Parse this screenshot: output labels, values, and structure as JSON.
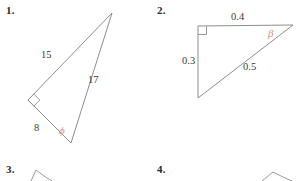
{
  "page": {
    "kind": "math-worksheet",
    "background_color": "#ffffff",
    "stroke_color": "#8d8d8d",
    "text_color": "#3a3a3a",
    "angle_color": "#e08a7a",
    "width": 296,
    "height": 181
  },
  "problems": [
    {
      "number": "1.",
      "figure": "right-triangle",
      "side_labels": [
        {
          "text": "15"
        },
        {
          "text": "17"
        },
        {
          "text": "8"
        }
      ],
      "angle_labels": [
        {
          "text": "ϕ"
        }
      ],
      "right_angle_marked": true
    },
    {
      "number": "2.",
      "figure": "right-triangle",
      "side_labels": [
        {
          "text": "0.4"
        },
        {
          "text": "0.3"
        },
        {
          "text": "0.5"
        }
      ],
      "angle_labels": [
        {
          "text": "β"
        }
      ],
      "right_angle_marked": true
    },
    {
      "number": "3.",
      "figure": "partial-triangle-cropped",
      "side_labels": [],
      "angle_labels": [],
      "right_angle_marked": false
    },
    {
      "number": "4.",
      "figure": "partial-triangle-cropped",
      "side_labels": [],
      "angle_labels": [],
      "right_angle_marked": false
    }
  ]
}
